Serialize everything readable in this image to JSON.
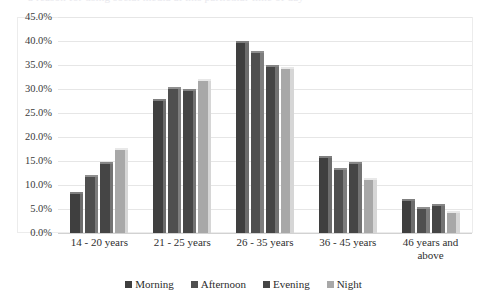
{
  "top_clip_text": "a reason for using social media at this particular time of day",
  "axis": {
    "y_ticks": [
      "45.0%",
      "40.0%",
      "35.0%",
      "30.0%",
      "25.0%",
      "20.0%",
      "15.0%",
      "10.0%",
      "5.0%",
      "0.0%"
    ]
  },
  "legend": {
    "items": [
      {
        "label": "Morning",
        "color": "#3f3f3f"
      },
      {
        "label": "Afternoon",
        "color": "#4f4f4f"
      },
      {
        "label": "Evening",
        "color": "#454545"
      },
      {
        "label": "Night",
        "color": "#a8a8a8"
      }
    ]
  },
  "chart_data": {
    "type": "bar",
    "title": "",
    "subtitle": "",
    "xlabel": "",
    "ylabel": "",
    "ylim": [
      0,
      45
    ],
    "ytick_step": 5,
    "ytick_format": "percent",
    "grid": true,
    "legend_position": "bottom",
    "orientation": "vertical",
    "grouping": "grouped",
    "categories": [
      "14 - 20 years",
      "21 - 25 years",
      "26 - 35 years",
      "36 - 45 years",
      "46 years and above"
    ],
    "series": [
      {
        "name": "Morning",
        "color": "#3f3f3f",
        "values": [
          8.5,
          28.0,
          40.0,
          16.0,
          7.0
        ]
      },
      {
        "name": "Afternoon",
        "color": "#4f4f4f",
        "values": [
          12.0,
          30.5,
          38.0,
          13.5,
          5.5
        ]
      },
      {
        "name": "Evening",
        "color": "#454545",
        "values": [
          14.8,
          30.0,
          35.0,
          14.8,
          6.0
        ]
      },
      {
        "name": "Night",
        "color": "#a8a8a8",
        "values": [
          17.8,
          32.0,
          34.5,
          11.5,
          4.5
        ]
      }
    ]
  }
}
